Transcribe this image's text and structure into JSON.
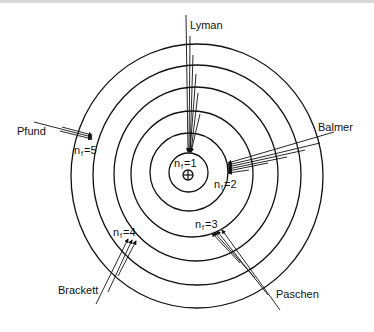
{
  "diagram": {
    "nucleus_icon": "circled-plus-icon",
    "orbits": [
      {
        "n": 1,
        "rx": 19.5,
        "ry": 19.5
      },
      {
        "n": 2,
        "rx": 39,
        "ry": 39
      },
      {
        "n": 3,
        "rx": 60,
        "ry": 63
      },
      {
        "n": 4,
        "rx": 82,
        "ry": 87
      },
      {
        "n": 5,
        "rx": 104,
        "ry": 110
      },
      {
        "n": 6,
        "rx": 126,
        "ry": 132
      }
    ],
    "series": [
      {
        "name": "Lyman",
        "final_label": "n",
        "final_sub": "f",
        "final_value": "=1"
      },
      {
        "name": "Balmer",
        "final_label": "n",
        "final_sub": "f",
        "final_value": "=2"
      },
      {
        "name": "Paschen",
        "final_label": "n",
        "final_sub": "f",
        "final_value": "=3"
      },
      {
        "name": "Brackett",
        "final_label": "n",
        "final_sub": "f",
        "final_value": "=4"
      },
      {
        "name": "Pfund",
        "final_label": "n",
        "final_sub": "f",
        "final_value": "=5"
      }
    ],
    "colors": {
      "ink": "#111111",
      "background": "#ffffff"
    }
  }
}
